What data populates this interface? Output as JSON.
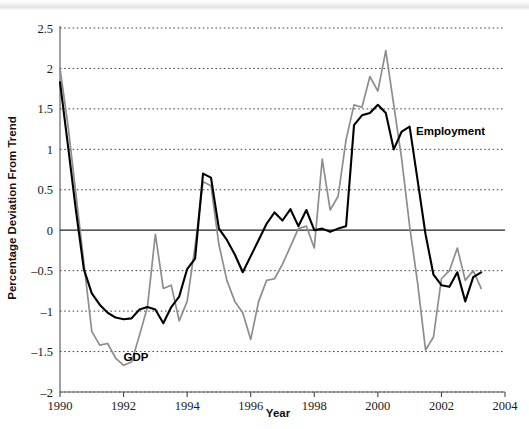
{
  "chart_data": {
    "type": "line",
    "title": "",
    "xlabel": "Year",
    "ylabel": "Percentage Deviation From Trend",
    "xlim": [
      1990,
      2004
    ],
    "ylim": [
      -2,
      2.5
    ],
    "xticks": [
      1990,
      1992,
      1994,
      1996,
      1998,
      2000,
      2002,
      2004
    ],
    "xtick_labels": [
      "1990",
      "1992",
      "1994",
      "1996",
      "1998",
      "2000",
      "2002",
      "2004"
    ],
    "yticks": [
      2.5,
      2,
      1.5,
      1,
      0.5,
      0,
      -0.5,
      -1,
      -1.5,
      -2
    ],
    "ytick_labels": [
      "2.5",
      "2",
      "1.5",
      "1",
      "0.5",
      "0",
      "–0.5",
      "–1",
      "–1.5",
      "–2"
    ],
    "grid": true,
    "legend_position": "inline-annotations",
    "annotations": [
      {
        "text": "GDP",
        "x": 1992.0,
        "y": -1.62,
        "color": "#000000"
      },
      {
        "text": "Employment",
        "x": 2001.2,
        "y": 1.18,
        "color": "#000000"
      }
    ],
    "series": [
      {
        "name": "GDP",
        "color": "#8d8d8d",
        "x": [
          1990.0,
          1990.25,
          1990.5,
          1990.75,
          1991.0,
          1991.25,
          1991.5,
          1991.75,
          1992.0,
          1992.25,
          1992.5,
          1992.75,
          1993.0,
          1993.25,
          1993.5,
          1993.75,
          1994.0,
          1994.25,
          1994.5,
          1994.75,
          1995.0,
          1995.25,
          1995.5,
          1995.75,
          1996.0,
          1996.25,
          1996.5,
          1996.75,
          1997.0,
          1997.25,
          1997.5,
          1997.75,
          1998.0,
          1998.25,
          1998.5,
          1998.75,
          1999.0,
          1999.25,
          1999.5,
          1999.75,
          2000.0,
          2000.25,
          2000.5,
          2000.75,
          2001.0,
          2001.25,
          2001.5,
          2001.75,
          2002.0,
          2002.25,
          2002.5,
          2002.75,
          2003.0,
          2003.25
        ],
        "values": [
          2.0,
          1.3,
          0.45,
          -0.4,
          -1.25,
          -1.42,
          -1.4,
          -1.58,
          -1.67,
          -1.63,
          -1.3,
          -0.95,
          -0.05,
          -0.72,
          -0.68,
          -1.12,
          -0.88,
          -0.2,
          0.6,
          0.55,
          -0.18,
          -0.62,
          -0.88,
          -1.02,
          -1.35,
          -0.88,
          -0.62,
          -0.6,
          -0.42,
          -0.2,
          0.02,
          0.05,
          -0.22,
          0.88,
          0.25,
          0.42,
          1.12,
          1.55,
          1.52,
          1.9,
          1.72,
          2.22,
          1.55,
          0.88,
          0.05,
          -0.65,
          -1.48,
          -1.32,
          -0.6,
          -0.5,
          -0.22,
          -0.62,
          -0.5,
          -0.72
        ]
      },
      {
        "name": "Employment",
        "color": "#000000",
        "x": [
          1990.0,
          1990.25,
          1990.5,
          1990.75,
          1991.0,
          1991.25,
          1991.5,
          1991.75,
          1992.0,
          1992.25,
          1992.5,
          1992.75,
          1993.0,
          1993.25,
          1993.5,
          1993.75,
          1994.0,
          1994.25,
          1994.5,
          1994.75,
          1995.0,
          1995.25,
          1995.5,
          1995.75,
          1996.0,
          1996.25,
          1996.5,
          1996.75,
          1997.0,
          1997.25,
          1997.5,
          1997.75,
          1998.0,
          1998.25,
          1998.5,
          1998.75,
          1999.0,
          1999.25,
          1999.5,
          1999.75,
          2000.0,
          2000.25,
          2000.5,
          2000.75,
          2001.0,
          2001.25,
          2001.5,
          2001.75,
          2002.0,
          2002.25,
          2002.5,
          2002.75,
          2003.0,
          2003.25
        ],
        "values": [
          1.83,
          1.05,
          0.25,
          -0.48,
          -0.78,
          -0.92,
          -1.02,
          -1.08,
          -1.1,
          -1.09,
          -0.98,
          -0.95,
          -0.98,
          -1.15,
          -0.95,
          -0.82,
          -0.48,
          -0.35,
          0.7,
          0.65,
          0.02,
          -0.12,
          -0.3,
          -0.52,
          -0.32,
          -0.12,
          0.08,
          0.22,
          0.12,
          0.26,
          0.05,
          0.25,
          0.0,
          0.02,
          -0.02,
          0.02,
          0.05,
          1.3,
          1.42,
          1.45,
          1.55,
          1.45,
          1.0,
          1.22,
          1.28,
          0.62,
          -0.05,
          -0.55,
          -0.68,
          -0.7,
          -0.52,
          -0.88,
          -0.58,
          -0.52
        ]
      }
    ]
  },
  "axes": {
    "y_title": "Percentage Deviation From Trend",
    "x_title": "Year"
  }
}
